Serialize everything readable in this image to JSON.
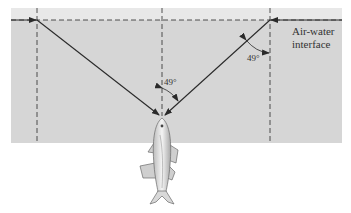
{
  "diagram": {
    "interface_label_line1": "Air-water",
    "interface_label_line2": "interface",
    "angle_center": "49°",
    "angle_right": "49°",
    "colors": {
      "water": "#d6d6d6",
      "air_band": "#e6e6e6",
      "line": "#2a2a2a",
      "background": "#ffffff"
    }
  }
}
